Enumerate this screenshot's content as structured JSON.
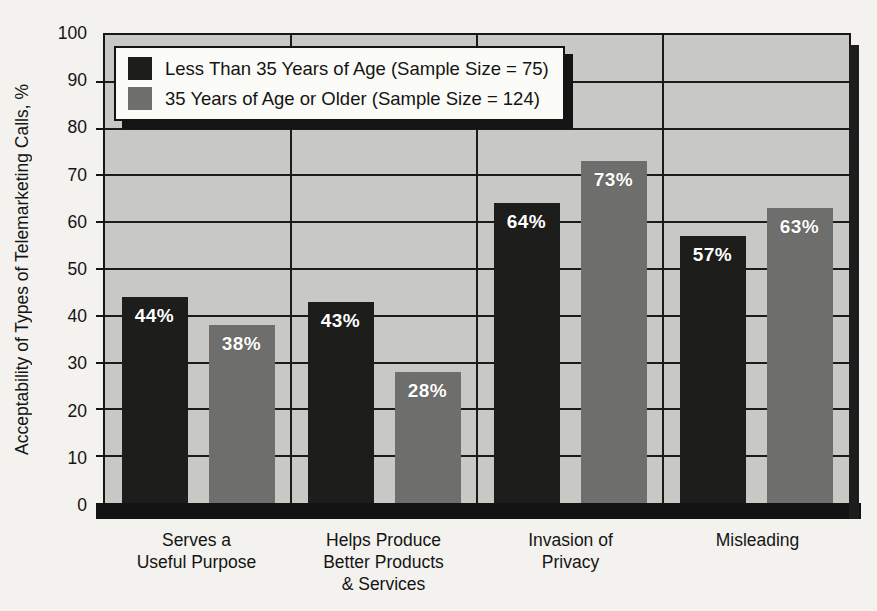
{
  "chart_data": {
    "type": "bar",
    "title": "",
    "xlabel": "",
    "ylabel": "Acceptability of Types of Telemarketing Calls, %",
    "ylim": [
      0,
      100
    ],
    "ytick_interval": 10,
    "yticks": [
      0,
      10,
      20,
      30,
      40,
      50,
      60,
      70,
      80,
      90,
      100
    ],
    "grid": "horizontal gridlines every 10, vertical separators between category groups",
    "legend_position": "top-left inside plot",
    "categories": [
      "Serves a\nUseful Purpose",
      "Helps Produce\nBetter Products\n& Services",
      "Invasion of\nPrivacy",
      "Misleading"
    ],
    "series": [
      {
        "name": "Less Than 35 Years of Age (Sample Size = 75)",
        "values": [
          44,
          43,
          64,
          57
        ],
        "labels": [
          "44%",
          "43%",
          "64%",
          "57%"
        ],
        "color": "#1d1d1c"
      },
      {
        "name": "35 Years of Age or Older (Sample Size = 124)",
        "values": [
          38,
          28,
          73,
          63
        ],
        "labels": [
          "38%",
          "28%",
          "73%",
          "63%"
        ],
        "color": "#6e6e6c"
      }
    ]
  },
  "colors": {
    "page_background": "#f3f2ee",
    "plot_background": "#c8c8c4",
    "line": "#161616",
    "bar_label_text": "#ffffff",
    "legend_background": "#fbfbf8"
  }
}
